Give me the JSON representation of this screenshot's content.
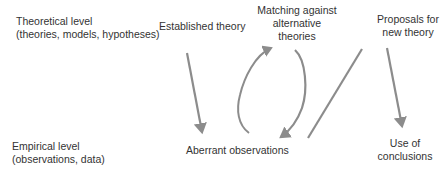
{
  "levels": {
    "theoretical": {
      "title": "Theoretical level",
      "subtitle": "(theories, models, hypotheses)"
    },
    "empirical": {
      "title": "Empirical level",
      "subtitle": "(observations, data)"
    }
  },
  "nodes": {
    "established": "Established theory",
    "matching": [
      "Matching against",
      "alternative",
      "theories"
    ],
    "proposals": [
      "Proposals for",
      "new theory"
    ],
    "aberrant": "Aberrant observations",
    "use": [
      "Use of",
      "conclusions"
    ]
  },
  "colors": {
    "arrow": "#8c8c8c",
    "text": "#333333"
  }
}
